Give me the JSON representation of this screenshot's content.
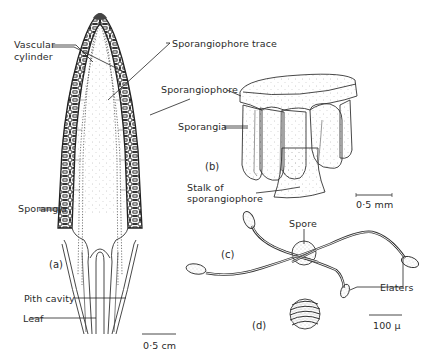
{
  "figure": {
    "panels": [
      {
        "id": "a",
        "label": "(a)",
        "description": "Longitudinal section of strobilus"
      },
      {
        "id": "b",
        "label": "(b)",
        "description": "Single sporangiophore with sporangia"
      },
      {
        "id": "c",
        "label": "(c)",
        "description": "Spore with uncoiled elaters"
      },
      {
        "id": "d",
        "label": "(d)",
        "description": "Spore with coiled elaters"
      }
    ],
    "labels": {
      "vascular_cylinder_1": "Vascular",
      "vascular_cylinder_2": "cylinder",
      "sporangiophore_trace": "Sporangiophore trace",
      "sporangiophore": "Sporangiophore",
      "sporangia_b": "Sporangia",
      "sporangia_a": "Sporangia",
      "stalk_1": "Stalk of",
      "stalk_2": "sporangiophore",
      "pith_cavity": "Pith cavity",
      "leaf": "Leaf",
      "spore": "Spore",
      "elaters": "Elaters"
    },
    "scale_bars": {
      "a": "0·5 cm",
      "b": "0·5 mm",
      "cd": "100 µ"
    },
    "colors": {
      "ink": "#2a2a2a",
      "stipple": "#9a9a9a",
      "background": "#ffffff"
    }
  }
}
